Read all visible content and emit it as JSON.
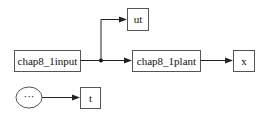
{
  "diagram": {
    "blocks": {
      "input": {
        "label": "chap8_1input"
      },
      "ut": {
        "label": "ut"
      },
      "plant": {
        "label": "chap8_1plant"
      },
      "x": {
        "label": "x"
      },
      "clock": {
        "label": "···"
      },
      "t": {
        "label": "t"
      }
    },
    "colors": {
      "line": "#222222",
      "border": "#555555",
      "background": "#ffffff"
    }
  }
}
